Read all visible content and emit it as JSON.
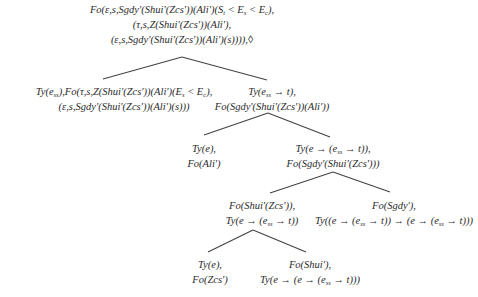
{
  "diagram": {
    "type": "derivation-tree",
    "line_color": "#444444",
    "nodes": [
      {
        "id": "root",
        "lines": [
          "Fo(ε,s,Sgdy'(Shui'(Zcs'))(Ali')(S_t < E_s < E_c),",
          "(τ,s,Z(Shui'(Zcs'))(Ali'),",
          "(ε,s,Sgdy'(Shui'(Zcs'))(Ali')(s)))),◊"
        ]
      },
      {
        "id": "n1-left",
        "lines": [
          "Ty(e_ss),Fo(τ,s,Z(Shui'(Zcs'))(Ali')(E_s < E_c),",
          "(ε,s,Sgdy'(Shui'(Zcs'))(Ali')(s)))"
        ]
      },
      {
        "id": "n1-right",
        "lines": [
          "Ty(e_ss → t),",
          "Fo(Sgdy'(Shui'(Zcs'))(Ali'))"
        ]
      },
      {
        "id": "n2-left",
        "lines": [
          "Ty(e),",
          "Fo(Ali')"
        ]
      },
      {
        "id": "n2-right",
        "lines": [
          "Ty(e → (e_ss → t)),",
          "Fo(Sgdy'(Shui'(Zcs')))"
        ]
      },
      {
        "id": "n3-left",
        "lines": [
          "Fo(Shui'(Zcs')),",
          "Ty(e → (e_ss → t))"
        ]
      },
      {
        "id": "n3-right",
        "lines": [
          "Fo(Sgdy'),",
          "Ty((e → (e_ss → t)) → (e → (e_ss → t)))"
        ]
      },
      {
        "id": "n4-left",
        "lines": [
          "Ty(e),",
          "Fo(Zcs')"
        ]
      },
      {
        "id": "n4-right",
        "lines": [
          "Fo(Shui'),",
          "Ty(e → (e → (e_ss → t)))"
        ]
      }
    ],
    "edges": [
      {
        "from": "root",
        "to": "n1-left",
        "x1": 182,
        "y1": 57,
        "x2": 103,
        "y2": 79
      },
      {
        "from": "root",
        "to": "n1-right",
        "x1": 182,
        "y1": 57,
        "x2": 267,
        "y2": 80
      },
      {
        "from": "n1-right",
        "to": "n2-left",
        "x1": 268,
        "y1": 113,
        "x2": 204,
        "y2": 135
      },
      {
        "from": "n1-right",
        "to": "n2-right",
        "x1": 268,
        "y1": 113,
        "x2": 330,
        "y2": 137
      },
      {
        "from": "n2-right",
        "to": "n3-left",
        "x1": 333,
        "y1": 172,
        "x2": 270,
        "y2": 193
      },
      {
        "from": "n2-right",
        "to": "n3-right",
        "x1": 333,
        "y1": 172,
        "x2": 390,
        "y2": 192
      },
      {
        "from": "n3-left",
        "to": "n4-left",
        "x1": 253,
        "y1": 230,
        "x2": 208,
        "y2": 252
      },
      {
        "from": "n3-left",
        "to": "n4-right",
        "x1": 253,
        "y1": 230,
        "x2": 306,
        "y2": 252
      }
    ]
  }
}
